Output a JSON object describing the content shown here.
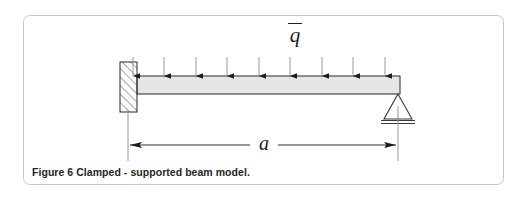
{
  "figure": {
    "caption": "Figure 6 Clamped - supported beam model.",
    "frame": {
      "border_color": "#c9c9c9",
      "background": "#ffffff"
    }
  },
  "diagram": {
    "type": "structural-beam-free-body-diagram",
    "title_symbol": "q",
    "load": {
      "symbol": "q",
      "overbar": true,
      "description": "uniformly distributed load",
      "arrow_count": 9,
      "arrow_direction": "down",
      "arrow_color": "#1d1d1d",
      "arrow_x_positions": [
        133,
        164,
        196,
        227,
        259,
        290,
        322,
        353,
        385
      ],
      "arrow_top_y": 57,
      "arrow_bottom_y": 77
    },
    "beam": {
      "x_start": 137,
      "x_end": 400,
      "y_top": 76,
      "y_bottom": 94,
      "fill": "#e6e6e6",
      "stroke": "#3a3a3a"
    },
    "left_support": {
      "name": "clamped-fixed-support",
      "x": 120,
      "y": 62,
      "width": 17,
      "height": 50,
      "hatch": true,
      "stroke": "#3a3a3a"
    },
    "right_support": {
      "name": "pinned-support",
      "apex_x": 398,
      "apex_y": 94,
      "half_width": 14,
      "base_y": 119,
      "ground_line_y": 123,
      "stroke": "#3a3a3a"
    },
    "dimension": {
      "label": "a",
      "y": 145,
      "x_left": 128,
      "x_right": 398,
      "extension_top_y": 110,
      "extension_bottom_y": 160,
      "stroke": "#1d1d1d",
      "arrowheads": "both"
    }
  }
}
